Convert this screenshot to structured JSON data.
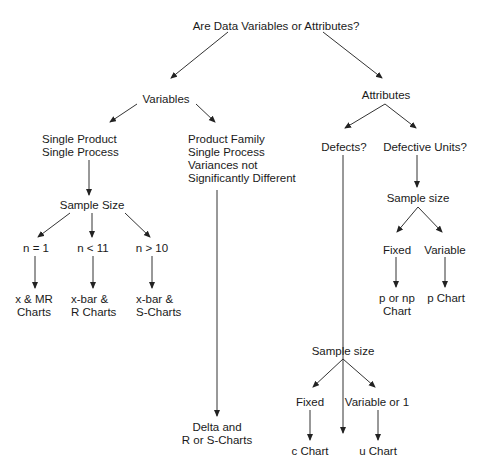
{
  "diagram": {
    "root": "Are Data Variables or Attributes?",
    "variables": {
      "label": "Variables",
      "single": {
        "lines": [
          "Single Product",
          "Single Process"
        ]
      },
      "family": {
        "lines": [
          "Product Family",
          "Single Process",
          "Variances not",
          "Significantly Different"
        ]
      },
      "sample_size": "Sample Size",
      "n1": "n = 1",
      "nlt11": "n < 11",
      "ngt10": "n > 10",
      "out_n1": {
        "lines": [
          "x & MR",
          "Charts"
        ]
      },
      "out_nlt11": {
        "lines": [
          "x-bar &",
          "R Charts"
        ]
      },
      "out_ngt10": {
        "lines": [
          "x-bar &",
          "S-Charts"
        ]
      },
      "out_family": {
        "lines": [
          "Delta and",
          "R or S-Charts"
        ]
      }
    },
    "attributes": {
      "label": "Attributes",
      "defects": "Defects?",
      "defective_units": "Defective Units?",
      "du_sample_size": "Sample size",
      "du_fixed": "Fixed",
      "du_variable": "Variable",
      "du_out_fixed": {
        "lines": [
          "p or np",
          "Chart"
        ]
      },
      "du_out_variable": "p Chart",
      "d_sample_size": "Sample size",
      "d_fixed": "Fixed",
      "d_variable": "Variable or 1",
      "d_out_fixed": "c Chart",
      "d_out_variable": "u Chart"
    }
  },
  "colors": {
    "line": "#333333",
    "text": "#1a1a1a",
    "background": "#ffffff"
  }
}
